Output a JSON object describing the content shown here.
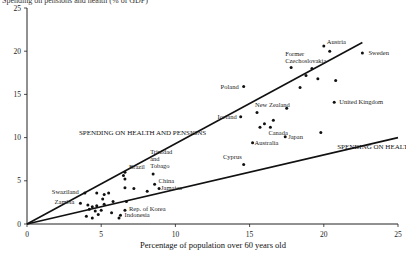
{
  "chart_data": {
    "type": "scatter",
    "title": "Spending on pensions and health (% of GDP)",
    "xlabel": "Percentage of population over 60 years old",
    "ylabel": "",
    "xlim": [
      0,
      25
    ],
    "ylim": [
      0,
      25
    ],
    "x_ticks": [
      "0",
      "5",
      "10",
      "15",
      "20",
      "25"
    ],
    "y_ticks": [
      "0",
      "5",
      "10",
      "15",
      "20",
      "25"
    ],
    "grid": false,
    "lines": [
      {
        "name": "SPENDING ON HEALTH AND PENSIONS",
        "x": [
          0,
          22.6
        ],
        "y": [
          0,
          21
        ]
      },
      {
        "name": "SPENDING ON HEALTH",
        "x": [
          0,
          25
        ],
        "y": [
          0,
          10
        ]
      }
    ],
    "points": [
      {
        "label": "Austria",
        "x": 20.0,
        "y": 20.6
      },
      {
        "label": "",
        "x": 20.4,
        "y": 20.0
      },
      {
        "label": "Sweden",
        "x": 22.6,
        "y": 19.8
      },
      {
        "label": "Former Czechoslovakia",
        "x": 17.8,
        "y": 18.1
      },
      {
        "label": "",
        "x": 19.2,
        "y": 18.0
      },
      {
        "label": "",
        "x": 18.8,
        "y": 17.2
      },
      {
        "label": "",
        "x": 19.6,
        "y": 16.8
      },
      {
        "label": "",
        "x": 20.8,
        "y": 16.6
      },
      {
        "label": "",
        "x": 18.4,
        "y": 15.8
      },
      {
        "label": "Poland",
        "x": 14.6,
        "y": 15.9
      },
      {
        "label": "United Kingdom",
        "x": 20.7,
        "y": 14.1
      },
      {
        "label": "",
        "x": 17.5,
        "y": 13.4
      },
      {
        "label": "New Zealand",
        "x": 15.5,
        "y": 12.9
      },
      {
        "label": "Iceland",
        "x": 14.4,
        "y": 12.4
      },
      {
        "label": "",
        "x": 16.6,
        "y": 12.0
      },
      {
        "label": "",
        "x": 16.0,
        "y": 11.6
      },
      {
        "label": "Canada",
        "x": 16.4,
        "y": 11.2
      },
      {
        "label": "",
        "x": 15.7,
        "y": 11.2
      },
      {
        "label": "",
        "x": 19.8,
        "y": 10.6
      },
      {
        "label": "Japan",
        "x": 17.4,
        "y": 10.1
      },
      {
        "label": "Australia",
        "x": 15.2,
        "y": 9.4
      },
      {
        "label": "Cyprus",
        "x": 14.6,
        "y": 6.9
      },
      {
        "label": "Trinidad and Tobago",
        "x": 8.5,
        "y": 5.8
      },
      {
        "label": "Brazil",
        "x": 6.6,
        "y": 6.0
      },
      {
        "label": "",
        "x": 6.5,
        "y": 5.6
      },
      {
        "label": "",
        "x": 6.6,
        "y": 5.2
      },
      {
        "label": "China",
        "x": 8.6,
        "y": 4.6
      },
      {
        "label": "Jamaica",
        "x": 8.9,
        "y": 4.1
      },
      {
        "label": "",
        "x": 8.1,
        "y": 3.8
      },
      {
        "label": "",
        "x": 7.2,
        "y": 4.1
      },
      {
        "label": "",
        "x": 6.6,
        "y": 4.2
      },
      {
        "label": "",
        "x": 5.5,
        "y": 3.6
      },
      {
        "label": "",
        "x": 5.2,
        "y": 3.4
      },
      {
        "label": "Swaziland",
        "x": 3.9,
        "y": 3.6
      },
      {
        "label": "",
        "x": 4.7,
        "y": 3.6
      },
      {
        "label": "",
        "x": 5.1,
        "y": 2.9
      },
      {
        "label": "",
        "x": 5.8,
        "y": 2.6
      },
      {
        "label": "",
        "x": 6.7,
        "y": 2.6
      },
      {
        "label": "Zambia",
        "x": 3.6,
        "y": 2.4
      },
      {
        "label": "",
        "x": 4.1,
        "y": 2.2
      },
      {
        "label": "",
        "x": 4.4,
        "y": 2.0
      },
      {
        "label": "",
        "x": 4.7,
        "y": 2.1
      },
      {
        "label": "",
        "x": 5.2,
        "y": 2.3
      },
      {
        "label": "",
        "x": 4.2,
        "y": 1.7
      },
      {
        "label": "",
        "x": 4.6,
        "y": 1.5
      },
      {
        "label": "",
        "x": 5.0,
        "y": 1.6
      },
      {
        "label": "",
        "x": 5.7,
        "y": 1.3
      },
      {
        "label": "",
        "x": 4.8,
        "y": 1.1
      },
      {
        "label": "",
        "x": 4.0,
        "y": 0.9
      },
      {
        "label": "",
        "x": 4.4,
        "y": 0.7
      },
      {
        "label": "Rep. of Korea",
        "x": 6.6,
        "y": 1.6
      },
      {
        "label": "Indonesia",
        "x": 6.3,
        "y": 1.0
      },
      {
        "label": "",
        "x": 6.2,
        "y": 0.7
      }
    ],
    "annotations": [
      {
        "text": "SPENDING ON HEALTH AND PENSIONS",
        "x": 3.5,
        "y": 10.3
      },
      {
        "text": "SPENDING ON HEALTH",
        "x": 20.9,
        "y": 8.7
      }
    ]
  }
}
